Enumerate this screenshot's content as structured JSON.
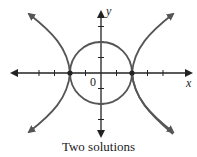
{
  "caption": "Two solutions",
  "axes": {
    "x_label": "x",
    "y_label": "y",
    "origin_label": "0"
  },
  "colors": {
    "curve": "#555555",
    "axis": "#222222",
    "point": "#222222"
  },
  "diagram": {
    "type": "graph",
    "curves": [
      {
        "name": "circle",
        "equation": "x^2 + y^2 = 4",
        "radius": 2
      },
      {
        "name": "hyperbola",
        "equation": "x^2 - y^2 = 4",
        "vertices": [
          [
            -2,
            0
          ],
          [
            2,
            0
          ]
        ]
      }
    ],
    "intersection_points": [
      [
        -2,
        0
      ],
      [
        2,
        0
      ]
    ],
    "x_ticks": [
      -4,
      -3,
      -2,
      -1,
      1,
      2,
      3,
      4
    ],
    "y_ticks": [
      -3,
      -2,
      -1,
      1,
      2,
      3
    ]
  }
}
